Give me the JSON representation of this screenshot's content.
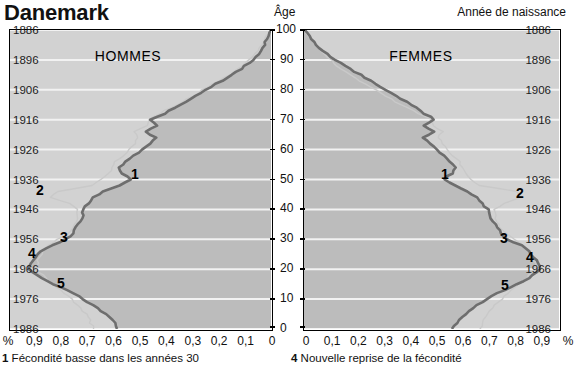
{
  "header": {
    "title": "Danemark",
    "age_axis_label": "Âge",
    "birth_year_axis_label": "Année de naissance"
  },
  "panels": {
    "men": {
      "title": "HOMMES"
    },
    "women": {
      "title": "FEMMES"
    }
  },
  "axes": {
    "birth_years": [
      "1886",
      "1896",
      "1906",
      "1916",
      "1926",
      "1936",
      "1946",
      "1956",
      "1966",
      "1976",
      "1986"
    ],
    "ages": [
      "100",
      "90",
      "80",
      "70",
      "60",
      "50",
      "40",
      "30",
      "20",
      "10",
      "0"
    ],
    "percent_left": [
      "%",
      "0,9",
      "0,8",
      "0,7",
      "0,6",
      "0,5",
      "0,4",
      "0,3",
      "0,2",
      "0,1",
      "0"
    ],
    "percent_right": [
      "0",
      "0,1",
      "0,2",
      "0,3",
      "0,4",
      "0,5",
      "0,6",
      "0,7",
      "0,8",
      "0,9",
      "%"
    ]
  },
  "markers": {
    "men": [
      {
        "id": "1"
      },
      {
        "id": "2"
      },
      {
        "id": "3"
      },
      {
        "id": "4"
      },
      {
        "id": "5"
      }
    ],
    "women": [
      {
        "id": "1"
      },
      {
        "id": "2"
      },
      {
        "id": "3"
      },
      {
        "id": "4"
      },
      {
        "id": "5"
      }
    ]
  },
  "footnotes": {
    "left": {
      "number": "1",
      "text": "Fécondité basse dans les années 30"
    },
    "right": {
      "number": "4",
      "text": "Nouvelle reprise de la fécondité"
    }
  },
  "colors": {
    "plot_light": "#d2d2d2",
    "plot_dark": "#bcbcbc",
    "curve_dark": "#6e6e6e",
    "curve_light": "#c9c9c9",
    "gridline": "#f2f2f2",
    "frame": "#000000"
  },
  "chart_data": {
    "type": "area",
    "title": "Danemark",
    "xlabel": "%",
    "ylabel": "Âge / Année de naissance",
    "grid": true,
    "legend_position": "none",
    "note": "Lexis-type double population pyramid: share of each birth cohort (%) by age, men on the left (axis reversed) and women on the right.",
    "axis": {
      "age_range": [
        0,
        100
      ],
      "age_ticks": [
        0,
        10,
        20,
        30,
        40,
        50,
        60,
        70,
        80,
        90,
        100
      ],
      "birth_year_range": [
        1986,
        1886
      ],
      "birth_year_ticks": [
        1886,
        1896,
        1906,
        1916,
        1926,
        1936,
        1946,
        1956,
        1966,
        1976,
        1986
      ],
      "percent_range": [
        0,
        1.0
      ],
      "percent_ticks": [
        0,
        0.1,
        0.2,
        0.3,
        0.4,
        0.5,
        0.6,
        0.7,
        0.8,
        0.9,
        1.0
      ]
    },
    "series": [
      {
        "name": "Hommes (effectif actuel)",
        "side": "left",
        "color": "#6e6e6e",
        "age": [
          100,
          98,
          96,
          94,
          92,
          90,
          88,
          86,
          84,
          82,
          80,
          78,
          76,
          74,
          72,
          71,
          70,
          69,
          68,
          67,
          66,
          65,
          64,
          62,
          60,
          58,
          56,
          54,
          52,
          51,
          50,
          49,
          48,
          47,
          46,
          45,
          44,
          43,
          42,
          41,
          40,
          38,
          36,
          34,
          32,
          31,
          30,
          29,
          28,
          27,
          26,
          24,
          22,
          20,
          18,
          16,
          14,
          12,
          10,
          8,
          6,
          4,
          2,
          0
        ],
        "values": [
          0.0,
          0.01,
          0.02,
          0.03,
          0.05,
          0.07,
          0.1,
          0.13,
          0.17,
          0.21,
          0.25,
          0.29,
          0.33,
          0.37,
          0.41,
          0.44,
          0.46,
          0.45,
          0.44,
          0.46,
          0.48,
          0.46,
          0.44,
          0.46,
          0.49,
          0.53,
          0.56,
          0.58,
          0.57,
          0.55,
          0.54,
          0.56,
          0.58,
          0.61,
          0.64,
          0.66,
          0.68,
          0.69,
          0.7,
          0.71,
          0.72,
          0.72,
          0.73,
          0.75,
          0.76,
          0.77,
          0.79,
          0.81,
          0.84,
          0.86,
          0.88,
          0.9,
          0.92,
          0.93,
          0.9,
          0.86,
          0.81,
          0.76,
          0.72,
          0.68,
          0.65,
          0.62,
          0.6,
          0.59
        ]
      },
      {
        "name": "Hommes (effectif initial de la cohorte)",
        "side": "left",
        "color": "#c9c9c9",
        "age": [
          100,
          96,
          92,
          88,
          84,
          80,
          76,
          72,
          70,
          68,
          66,
          64,
          60,
          56,
          52,
          48,
          46,
          44,
          42,
          40,
          36,
          32,
          28,
          24,
          20,
          16,
          12,
          8,
          4,
          0
        ],
        "values": [
          0.0,
          0.03,
          0.06,
          0.11,
          0.18,
          0.26,
          0.34,
          0.43,
          0.47,
          0.48,
          0.52,
          0.51,
          0.54,
          0.6,
          0.62,
          0.68,
          0.82,
          0.84,
          0.77,
          0.74,
          0.74,
          0.78,
          0.85,
          0.89,
          0.9,
          0.85,
          0.79,
          0.74,
          0.7,
          0.68
        ]
      },
      {
        "name": "Femmes (effectif actuel)",
        "side": "right",
        "color": "#6e6e6e",
        "age": [
          100,
          98,
          96,
          94,
          92,
          90,
          88,
          86,
          84,
          82,
          80,
          78,
          76,
          74,
          72,
          71,
          70,
          69,
          68,
          67,
          66,
          65,
          64,
          62,
          60,
          58,
          56,
          54,
          52,
          51,
          50,
          49,
          48,
          47,
          46,
          45,
          44,
          43,
          42,
          41,
          40,
          38,
          36,
          34,
          32,
          31,
          30,
          29,
          28,
          27,
          26,
          24,
          22,
          20,
          18,
          16,
          14,
          12,
          10,
          8,
          6,
          4,
          2,
          0
        ],
        "values": [
          0.0,
          0.02,
          0.04,
          0.06,
          0.09,
          0.12,
          0.16,
          0.2,
          0.24,
          0.28,
          0.32,
          0.36,
          0.4,
          0.44,
          0.47,
          0.5,
          0.51,
          0.49,
          0.47,
          0.49,
          0.51,
          0.49,
          0.47,
          0.49,
          0.52,
          0.55,
          0.57,
          0.59,
          0.58,
          0.56,
          0.55,
          0.57,
          0.59,
          0.62,
          0.64,
          0.66,
          0.68,
          0.69,
          0.7,
          0.71,
          0.72,
          0.73,
          0.74,
          0.76,
          0.77,
          0.78,
          0.8,
          0.82,
          0.85,
          0.87,
          0.88,
          0.9,
          0.92,
          0.93,
          0.9,
          0.86,
          0.81,
          0.76,
          0.72,
          0.68,
          0.65,
          0.62,
          0.6,
          0.58
        ]
      },
      {
        "name": "Femmes (effectif initial de la cohorte)",
        "side": "right",
        "color": "#c9c9c9",
        "age": [
          100,
          96,
          92,
          88,
          84,
          80,
          76,
          72,
          70,
          68,
          66,
          64,
          60,
          56,
          52,
          48,
          46,
          44,
          42,
          40,
          36,
          32,
          28,
          24,
          20,
          16,
          12,
          8,
          4,
          0
        ],
        "values": [
          0.0,
          0.04,
          0.08,
          0.13,
          0.2,
          0.28,
          0.36,
          0.45,
          0.5,
          0.51,
          0.54,
          0.53,
          0.56,
          0.61,
          0.63,
          0.69,
          0.83,
          0.85,
          0.78,
          0.75,
          0.75,
          0.79,
          0.86,
          0.9,
          0.91,
          0.86,
          0.8,
          0.75,
          0.71,
          0.69
        ]
      }
    ],
    "annotations": [
      {
        "id": "1",
        "label": "Fécondité basse dans les années 30",
        "birth_year": 1930,
        "age": 55
      },
      {
        "id": "2",
        "label": "",
        "birth_year": 1939,
        "age": 46
      },
      {
        "id": "3",
        "label": "",
        "birth_year": 1953,
        "age": 32
      },
      {
        "id": "4",
        "label": "Nouvelle reprise de la fécondité",
        "birth_year": 1964,
        "age": 22
      },
      {
        "id": "5",
        "label": "",
        "birth_year": 1975,
        "age": 11
      }
    ]
  }
}
